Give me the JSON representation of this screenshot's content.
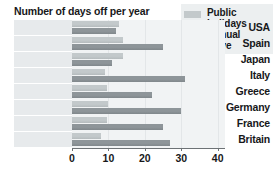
{
  "chart_data": {
    "type": "bar",
    "orientation": "horizontal",
    "title": "Number of days off per year",
    "xlabel": "",
    "ylabel": "",
    "xlim": [
      0,
      42
    ],
    "xticks": [
      0,
      10,
      20,
      30,
      40
    ],
    "xtick_labels": [
      "0",
      "10",
      "20",
      "30",
      "40"
    ],
    "grid": true,
    "legend_position": "top-right",
    "categories": [
      "USA",
      "Spain",
      "Japan",
      "Italy",
      "Greece",
      "Germany",
      "France",
      "Britain"
    ],
    "series": [
      {
        "name": "Public holidays",
        "legend_label": "Public\nholidays",
        "color": "#c3c9cb",
        "values": [
          13,
          14,
          14,
          9,
          9.5,
          10,
          9.5,
          8
        ]
      },
      {
        "name": "Annual leave",
        "legend_label": "Annual\nleave",
        "color": "#8e9599",
        "values": [
          12,
          25,
          11,
          31,
          22,
          30,
          25,
          27
        ]
      }
    ]
  },
  "style": {
    "background": "#ffffff",
    "panel_background": "#f1f3f4",
    "label_background": "#e7eaec",
    "legend_background": "#eceff0",
    "axis_color": "#6d7275",
    "grid_color": "#e3e6e8",
    "text_color": "#17181a"
  }
}
